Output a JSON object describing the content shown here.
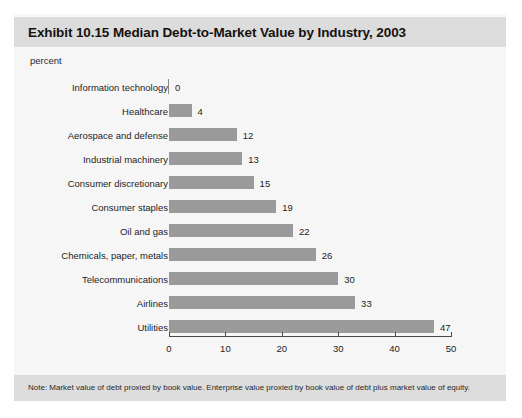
{
  "card": {
    "title": "Exhibit 10.15 Median Debt-to-Market Value by Industry, 2003",
    "unit_label": "percent",
    "note": "Note: Market value of debt proxied by book value. Enterprise value proxied by book value of debt plus market value of equity."
  },
  "colors": {
    "bar": "#9a9a9a",
    "title_band": "#dcdcdc",
    "note_band": "#dddddd",
    "plot_background": "#f6f6f6",
    "axis": "#4a4a4a"
  },
  "chart_data": {
    "type": "bar",
    "orientation": "horizontal",
    "title": "Exhibit 10.15 Median Debt-to-Market Value by Industry, 2003",
    "xlabel": "percent",
    "ylabel": "",
    "xlim": [
      0,
      50
    ],
    "xticks": [
      0,
      10,
      20,
      30,
      40,
      50
    ],
    "grid": false,
    "legend": "none",
    "categories": [
      "Information technology",
      "Healthcare",
      "Aerospace and defense",
      "Industrial machinery",
      "Consumer discretionary",
      "Consumer staples",
      "Oil and gas",
      "Chemicals, paper, metals",
      "Telecommunications",
      "Airlines",
      "Utilities"
    ],
    "values": [
      0,
      4,
      12,
      13,
      15,
      19,
      22,
      26,
      30,
      33,
      47
    ],
    "annotation": "Note: Market value of debt proxied by book value. Enterprise value proxied by book value of debt plus market value of equity."
  }
}
